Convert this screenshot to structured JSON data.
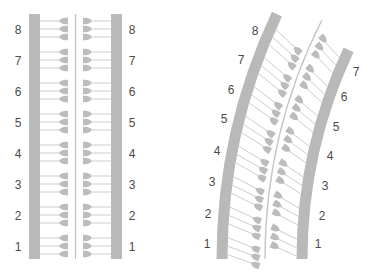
{
  "colors": {
    "bar": "#b9b9b9",
    "line": "#cdcdcd",
    "glyph": "#bcbcbc",
    "center_line": "#c4c4c4",
    "label": "#4a4a4a",
    "background": "#ffffff"
  },
  "straight_diagram": {
    "left_bar": {
      "x": 29,
      "width": 11,
      "top": 14,
      "bottom": 259
    },
    "right_bar": {
      "x": 111,
      "width": 11,
      "top": 14,
      "bottom": 259
    },
    "center_line_x": 75.5,
    "left_label_x": 18,
    "right_label_x": 132,
    "groups": [
      {
        "label": "8",
        "center_y": 29
      },
      {
        "label": "7",
        "center_y": 60
      },
      {
        "label": "6",
        "center_y": 91
      },
      {
        "label": "5",
        "center_y": 122
      },
      {
        "label": "4",
        "center_y": 153
      },
      {
        "label": "3",
        "center_y": 184
      },
      {
        "label": "2",
        "center_y": 215
      },
      {
        "label": "1",
        "center_y": 246
      }
    ],
    "line_offsets": [
      -8,
      0,
      8
    ]
  },
  "curved_diagram": {
    "arc_center": {
      "x": 795,
      "y": 259
    },
    "left_bar_radius": 573,
    "right_bar_radius": 493,
    "center_line_radius": 530,
    "bar_width": 11,
    "left_bar_angles_deg": [
      0,
      25.3
    ],
    "right_bar_angles_deg": [
      0,
      25.1
    ],
    "center_line_angles_deg": [
      0,
      26.8
    ],
    "left_groups": [
      {
        "label": "1",
        "angle": 1.3,
        "label_pos": [
          207,
          248
        ]
      },
      {
        "label": "2",
        "angle": 4.4,
        "label_pos": [
          208,
          218
        ]
      },
      {
        "label": "3",
        "angle": 7.5,
        "label_pos": [
          212,
          186
        ]
      },
      {
        "label": "4",
        "angle": 10.6,
        "label_pos": [
          217,
          155
        ]
      },
      {
        "label": "5",
        "angle": 13.7,
        "label_pos": [
          224,
          123
        ]
      },
      {
        "label": "6",
        "angle": 16.8,
        "label_pos": [
          231,
          94
        ]
      },
      {
        "label": "7",
        "angle": 19.9,
        "label_pos": [
          241,
          64
        ]
      },
      {
        "label": "8",
        "angle": 23.0,
        "label_pos": [
          255,
          35
        ]
      }
    ],
    "right_groups": [
      {
        "label": "1",
        "angle": 1.3,
        "label_pos": [
          318,
          248
        ]
      },
      {
        "label": "2",
        "angle": 4.9,
        "label_pos": [
          322,
          220
        ]
      },
      {
        "label": "3",
        "angle": 8.5,
        "label_pos": [
          325,
          190
        ]
      },
      {
        "label": "4",
        "angle": 12.1,
        "label_pos": [
          330,
          160
        ]
      },
      {
        "label": "5",
        "angle": 15.7,
        "label_pos": [
          336,
          131
        ]
      },
      {
        "label": "6",
        "angle": 19.3,
        "label_pos": [
          344,
          101
        ]
      },
      {
        "label": "7",
        "angle": 22.9,
        "label_pos": [
          356,
          76
        ]
      }
    ],
    "left_group_spacing_deg": 0.85,
    "right_group_spacing_deg": 0.97
  }
}
